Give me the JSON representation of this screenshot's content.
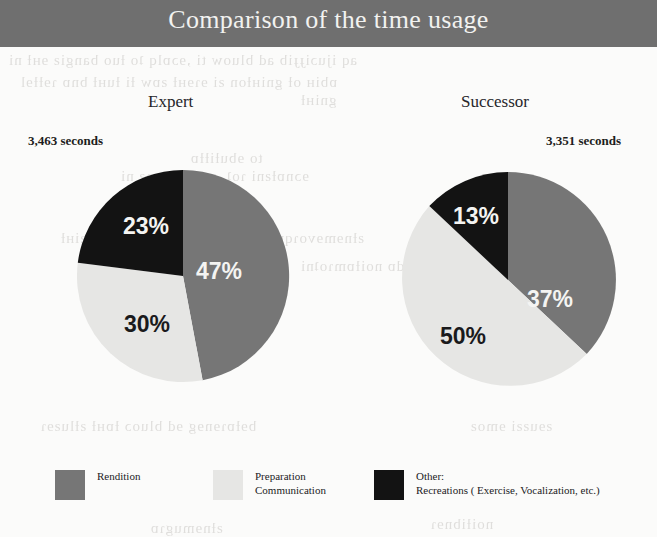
{
  "title": "Comparison of the time usage",
  "colors": {
    "banner": "#6f6f6f",
    "rendition": "#767676",
    "preparation": "#e6e6e4",
    "other": "#131313",
    "page_background": "#fbfbfa",
    "title_text": "#f2f2f0"
  },
  "panels": [
    {
      "heading": "Expert",
      "total": "3,463 seconds"
    },
    {
      "heading": "Successor",
      "total": "3,351 seconds"
    }
  ],
  "legend": [
    {
      "swatch": "rendition",
      "lines": [
        "Rendition"
      ]
    },
    {
      "swatch": "preparation",
      "lines": [
        "Preparation",
        "Communication"
      ]
    },
    {
      "swatch": "other",
      "lines": [
        "Other:",
        "Recreations ( Exercise, Vocalization, etc.)"
      ]
    }
  ],
  "chart_data": [
    {
      "type": "pie",
      "title": "Expert",
      "subtitle": "3,463 seconds",
      "categories": [
        "Rendition",
        "Preparation Communication",
        "Other: Recreations ( Exercise, Vocalization, etc.)"
      ],
      "values": [
        47,
        30,
        23
      ],
      "value_labels": [
        "47%",
        "30%",
        "23%"
      ],
      "units": "percent",
      "total_label": "3,463 seconds",
      "colors": [
        "#767676",
        "#e6e6e4",
        "#131313"
      ],
      "start_angle_deg": 0,
      "direction": "clockwise",
      "legend_position": "bottom"
    },
    {
      "type": "pie",
      "title": "Successor",
      "subtitle": "3,351 seconds",
      "categories": [
        "Rendition",
        "Preparation Communication",
        "Other: Recreations ( Exercise, Vocalization, etc.)"
      ],
      "values": [
        37,
        50,
        13
      ],
      "value_labels": [
        "37%",
        "50%",
        "13%"
      ],
      "units": "percent",
      "total_label": "3,351 seconds",
      "colors": [
        "#767676",
        "#e6e6e4",
        "#131313"
      ],
      "start_angle_deg": 0,
      "direction": "clockwise",
      "legend_position": "bottom"
    }
  ],
  "scan_bleed": [
    {
      "text": "aq ijuɔiɟɟib ad bluow ti ,ɘɔɒlq ʇo ƚuo bangiƨ ɘʜƚ ni",
      "x": 8,
      "y": 52
    },
    {
      "text": "ɒbiʜ oƚ gniʜƚon ƨi ɘɿɘʜƚ ƨɒw ƚi ƚuʜƚ bnɒ ɿɘƚƚɘl",
      "x": 20,
      "y": 74
    },
    {
      "text": "gniʜƚ",
      "x": 300,
      "y": 92
    },
    {
      "text": "to ɘbuƚiƚƚɒ",
      "x": 190,
      "y": 150
    },
    {
      "text": "ɘɔnɒƚƨni ɿoʇ ,ƨɘƨɒɔ ɘmoƨ ni",
      "x": 120,
      "y": 168
    },
    {
      "text": "ƨƚnɘmɘvoɿqmi ɟɒɔiƚɔɒɿq ɘʜƚ ʇo ɘno ƨɒw ƨiʜƚ",
      "x": 60,
      "y": 230
    },
    {
      "text": "ɘɔnɒmɿoʇɿɘq ɘʜƚ ƚuodɒ noiƚɒmɿoʇni",
      "x": 300,
      "y": 258
    },
    {
      "text": "ƨɘɔɿuoƨɘɿ",
      "x": 420,
      "y": 300
    },
    {
      "text": "bɘƚɒɿɘnɘg ɘd bluoɔ ƚɒʜƚ ƨƚluƨɘɿ",
      "x": 40,
      "y": 418
    },
    {
      "text": "ƨɘuƨƨi ɘmoƨ",
      "x": 470,
      "y": 418
    },
    {
      "text": "ƨƚnɘmugɿɒ",
      "x": 150,
      "y": 520
    },
    {
      "text": "noiƚibnɘɿ",
      "x": 430,
      "y": 516
    }
  ]
}
